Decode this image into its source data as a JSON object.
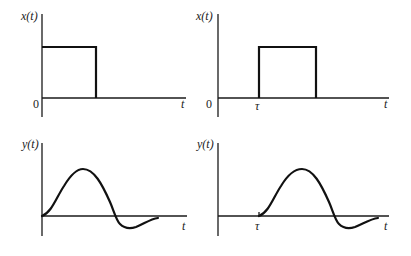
{
  "figure": {
    "panels": [
      {
        "id": "input-no-delay",
        "ylabel": "x(t)",
        "xlabel": "t",
        "origin_label": "0",
        "signal": "rectangular pulse starting at 0"
      },
      {
        "id": "input-delayed",
        "ylabel": "x(t)",
        "xlabel": "t",
        "origin_label": "0",
        "delay_label": "τ",
        "signal": "rectangular pulse starting at τ"
      },
      {
        "id": "output-no-delay",
        "ylabel": "y(t)",
        "xlabel": "t",
        "signal": "response rising from 0, peak, undershoot, settling"
      },
      {
        "id": "output-delayed",
        "ylabel": "y(t)",
        "xlabel": "t",
        "delay_label": "τ",
        "signal": "same response shifted by τ"
      }
    ]
  },
  "colors": {
    "line": "#111111",
    "background": "#ffffff"
  }
}
